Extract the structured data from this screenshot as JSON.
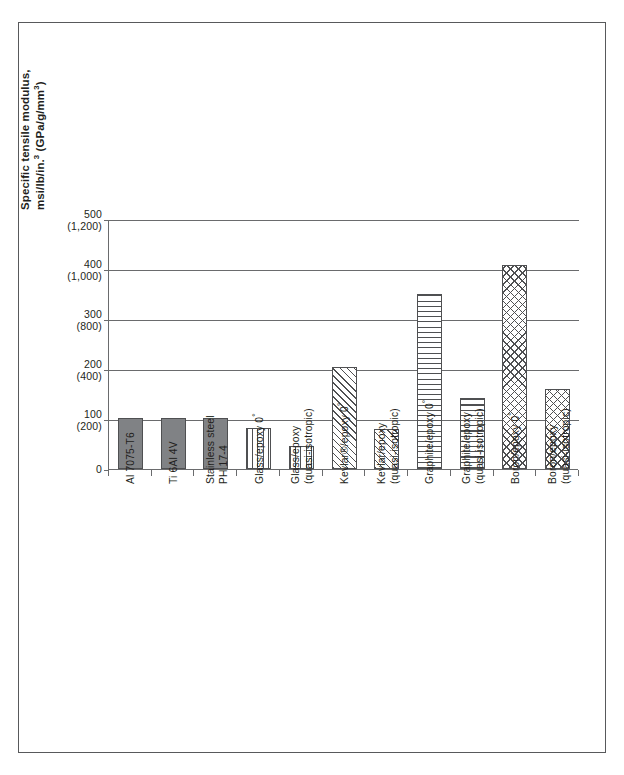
{
  "chart_data": {
    "type": "bar",
    "title": "",
    "xlabel": "",
    "ylabel": "Specific tensile modulus, msi/lb/in.³ (GPa/g/mm³)",
    "ylabel_line1": "Specific tensile modulus,",
    "ylabel_line2_a": "msi/lb/in.",
    "ylabel_line2_sup": "3",
    "ylabel_line2_b": " (GPa/g/mm",
    "ylabel_line2_sup2": "3",
    "ylabel_line2_c": ")",
    "ylim": [
      0,
      500
    ],
    "ylim_secondary": [
      0,
      1200
    ],
    "grid": true,
    "legend": "none",
    "y_ticks_primary": [
      "500",
      "400",
      "300",
      "200",
      "100",
      "0"
    ],
    "y_ticks_secondary": [
      "(1,200)",
      "(1,000)",
      "(800)",
      "(400)",
      "(200)",
      ""
    ],
    "y_axis_pairs": [
      {
        "major": "500",
        "minor": "(1,200)",
        "value": 500
      },
      {
        "major": "400",
        "minor": "(1,000)",
        "value": 400
      },
      {
        "major": "300",
        "minor": "(800)",
        "value": 300
      },
      {
        "major": "200",
        "minor": "(400)",
        "value": 200
      },
      {
        "major": "100",
        "minor": "(200)",
        "value": 100
      },
      {
        "major": "0",
        "minor": "",
        "value": 0
      }
    ],
    "categories": [
      "Al 7075-T6",
      "Ti 6Al 4V",
      "Stainless steel PH 17-4",
      "Glass/epoxy 0°",
      "Glass/epoxy (quasi-isotropic)",
      "Kevlar®/epoxy 0°",
      "Kevlar/epoxy (quasi-isotropic)",
      "Graphite/epoxy 0°",
      "Graphite/epoxy (quasi-isotropic)",
      "Boron/epoxy 0°",
      "Boron/epoxy (quasi-isotropic)"
    ],
    "values": [
      103,
      102,
      103,
      82,
      47,
      205,
      80,
      350,
      142,
      408,
      160
    ],
    "bars": [
      {
        "label_line1": "Al 7075-T6",
        "label_line2": "",
        "value": 103,
        "pattern": "solid"
      },
      {
        "label_line1": "Ti 6Al 4V",
        "label_line2": "",
        "value": 102,
        "pattern": "solid"
      },
      {
        "label_line1": "Stainless steel",
        "label_line2": "PH 17-4",
        "value": 103,
        "pattern": "solid"
      },
      {
        "label_line1": "Glass/epoxy 0°",
        "label_line2": "",
        "value": 82,
        "pattern": "vertical-stripes"
      },
      {
        "label_line1": "Glass/epoxy",
        "label_line2": "(quasi-isotropic)",
        "value": 47,
        "pattern": "vertical-stripes"
      },
      {
        "label_line1": "Kevlar®/epoxy 0°",
        "label_line2": "",
        "value": 205,
        "pattern": "diagonal-hatch"
      },
      {
        "label_line1": "Kevlar/epoxy",
        "label_line2": "(quasi-isotropic)",
        "value": 80,
        "pattern": "diagonal-hatch"
      },
      {
        "label_line1": "Graphite/epoxy 0°",
        "label_line2": "",
        "value": 350,
        "pattern": "horizontal-stripes"
      },
      {
        "label_line1": "Graphite/epoxy",
        "label_line2": "(quasi-isotropic)",
        "value": 142,
        "pattern": "horizontal-stripes"
      },
      {
        "label_line1": "Boron/epoxy 0°",
        "label_line2": "",
        "value": 408,
        "pattern": "cross-hatch"
      },
      {
        "label_line1": "Boron/epoxy",
        "label_line2": "(quasi-isotropic)",
        "value": 160,
        "pattern": "cross-hatch"
      }
    ],
    "colors": {
      "line": "#6a6b6d",
      "hatch": "#4f5052",
      "solid_fill": "#808285",
      "text": "#231f20",
      "background": "#ffffff",
      "frame": "#58595b"
    }
  }
}
